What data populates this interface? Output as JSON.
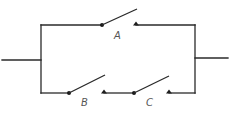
{
  "diagram": {
    "type": "circuit",
    "colors": {
      "line": "#2a2a2a",
      "label": "#555555",
      "background": "#ffffff"
    },
    "switches": [
      {
        "id": "A",
        "label": "A",
        "branch": "top",
        "state": "open"
      },
      {
        "id": "B",
        "label": "B",
        "branch": "bottom",
        "state": "open"
      },
      {
        "id": "C",
        "label": "C",
        "branch": "bottom",
        "state": "open"
      }
    ],
    "terminals": [
      {
        "id": "left-terminal"
      },
      {
        "id": "right-terminal"
      }
    ]
  }
}
